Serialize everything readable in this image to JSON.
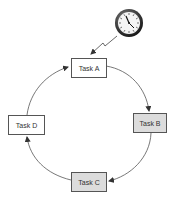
{
  "diagram": {
    "type": "cycle",
    "trigger": {
      "icon": "clock-icon",
      "label": "",
      "connector": "lightning-bolt",
      "target": "Task A"
    },
    "nodes": [
      {
        "id": "a",
        "label": "Task A",
        "fill": "#ffffff"
      },
      {
        "id": "b",
        "label": "Task B",
        "fill": "#dcdcdc"
      },
      {
        "id": "c",
        "label": "Task C",
        "fill": "#dcdcdc"
      },
      {
        "id": "d",
        "label": "Task D",
        "fill": "#ffffff"
      }
    ],
    "edges": [
      {
        "from": "Task A",
        "to": "Task B"
      },
      {
        "from": "Task B",
        "to": "Task C"
      },
      {
        "from": "Task C",
        "to": "Task D"
      },
      {
        "from": "Task D",
        "to": "Task A"
      }
    ],
    "colors": {
      "stroke": "#555555",
      "shaded_fill": "#dcdcdc",
      "clock_rim": "#222222"
    }
  }
}
